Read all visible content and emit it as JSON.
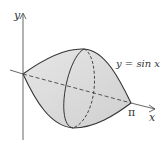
{
  "figure": {
    "curve_label": "y = sin x",
    "x_axis_label": "x",
    "y_axis_label": "y",
    "pi_label": "π",
    "colors": {
      "fill": "#dcdcdc",
      "stroke": "#333333",
      "axis": "#555555"
    }
  }
}
